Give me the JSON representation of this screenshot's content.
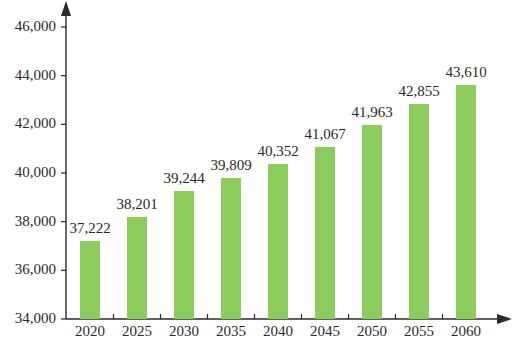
{
  "chart_data": {
    "type": "bar",
    "title": "",
    "xlabel": "",
    "ylabel": "",
    "categories": [
      "2020",
      "2025",
      "2030",
      "2035",
      "2040",
      "2045",
      "2050",
      "2055",
      "2060"
    ],
    "values": [
      37222,
      38201,
      39244,
      39809,
      40352,
      41067,
      41963,
      42855,
      43610
    ],
    "value_labels": [
      "37,222",
      "38,201",
      "39,244",
      "39,809",
      "40,352",
      "41,067",
      "41,963",
      "42,855",
      "43,610"
    ],
    "ylim": [
      34000,
      46000
    ],
    "yticks": [
      34000,
      36000,
      38000,
      40000,
      42000,
      44000,
      46000
    ],
    "ytick_labels": [
      "34,000",
      "36,000",
      "38,000",
      "40,000",
      "42,000",
      "44,000",
      "46,000"
    ],
    "grid": false,
    "legend": null,
    "bar_color": "#8ccc5c",
    "axis_color": "#2a2a2a"
  }
}
